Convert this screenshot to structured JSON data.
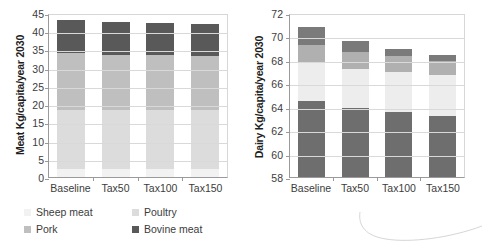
{
  "chart_data": [
    {
      "type": "bar",
      "stacked": true,
      "title": "",
      "xlabel": "",
      "ylabel": "Meat Kg/capita/year 2030",
      "categories": [
        "Baseline",
        "Tax50",
        "Tax100",
        "Tax150"
      ],
      "ylim": [
        0,
        45
      ],
      "yticks": [
        0,
        5,
        10,
        15,
        20,
        25,
        30,
        35,
        40,
        45
      ],
      "grid": true,
      "legend_position": "bottom",
      "series": [
        {
          "name": "Sheep meat",
          "color": "#f2f2f2",
          "values": [
            2.2,
            2.2,
            2.1,
            2.1
          ]
        },
        {
          "name": "Poultry",
          "color": "#dcdcdc",
          "values": [
            16.2,
            16.2,
            16.2,
            16.2
          ]
        },
        {
          "name": "Pork",
          "color": "#bfbfbf",
          "values": [
            15.5,
            15.2,
            15.1,
            15.0
          ]
        },
        {
          "name": "Bovine meat",
          "color": "#595959",
          "values": [
            9.1,
            9.0,
            8.9,
            8.7
          ]
        }
      ],
      "totals": [
        43.0,
        42.6,
        42.3,
        42.0
      ]
    },
    {
      "type": "bar",
      "stacked": true,
      "title": "",
      "xlabel": "",
      "ylabel": "Dairy Kg/capita/year 2030",
      "categories": [
        "Baseline",
        "Tax50",
        "Tax100",
        "Tax150"
      ],
      "ylim": [
        58,
        72
      ],
      "yticks": [
        58,
        60,
        62,
        64,
        66,
        68,
        70,
        72
      ],
      "grid": true,
      "legend_position": "bottom",
      "series": [
        {
          "name": "Whole milk powder",
          "color": "#6e6e6e",
          "values": [
            6.45,
            5.9,
            5.55,
            5.2
          ]
        },
        {
          "name": "Butter",
          "color": "#ededed",
          "values": [
            3.25,
            3.35,
            3.4,
            3.5
          ]
        },
        {
          "name": "Cheese",
          "color": "#b0b0b0",
          "values": [
            1.6,
            1.45,
            1.4,
            1.2
          ]
        },
        {
          "name": "Fresh Dairy Products",
          "color": "#7a7a7a",
          "values": [
            1.5,
            0.9,
            0.55,
            0.5
          ]
        }
      ],
      "totals": [
        70.75,
        70.15,
        69.9,
        69.4
      ],
      "legend_order": [
        "Fresh Dairy Products",
        "Cheese",
        "Butter",
        "Skim milk powder",
        "Whole milk powder"
      ],
      "skim_milk_powder": {
        "name": "Skim milk powder",
        "color": "#ffffff"
      }
    }
  ],
  "left": {
    "ylabel": "Meat Kg/capita/year 2030",
    "yticks": [
      "45",
      "40",
      "35",
      "30",
      "25",
      "20",
      "15",
      "10",
      "5",
      "0"
    ],
    "categories": [
      "Baseline",
      "Tax50",
      "Tax100",
      "Tax150"
    ],
    "legend": [
      {
        "label": "Sheep meat",
        "color": "#f2f2f2"
      },
      {
        "label": "Poultry",
        "color": "#dcdcdc"
      },
      {
        "label": "Pork",
        "color": "#bfbfbf"
      },
      {
        "label": "Bovine meat",
        "color": "#595959"
      }
    ]
  },
  "right": {
    "ylabel": "Dairy Kg/capita/year 2030",
    "yticks": [
      "72",
      "70",
      "68",
      "66",
      "64",
      "62",
      "60",
      "58"
    ],
    "categories": [
      "Baseline",
      "Tax50",
      "Tax100",
      "Tax150"
    ],
    "legend": [
      {
        "label": "Fresh Dairy Products",
        "color": "#7a7a7a"
      },
      {
        "label": "Cheese",
        "color": "#d8d8d8"
      },
      {
        "label": "Butter",
        "color": "#ededed"
      },
      {
        "label": "Skim milk powder",
        "color": "#ffffff"
      },
      {
        "label": "Whole milk powder",
        "color": "#6e6e6e"
      }
    ]
  }
}
